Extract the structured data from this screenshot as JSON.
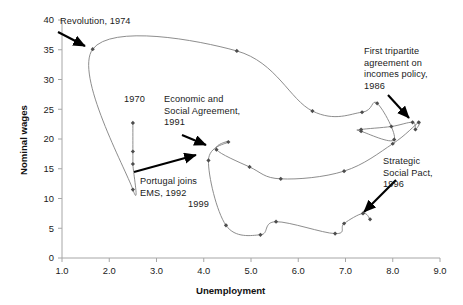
{
  "chart_data": {
    "type": "line",
    "title": "",
    "xlabel": "Unemployment",
    "ylabel": "Nominal wages",
    "xlim": [
      1.0,
      9.0
    ],
    "ylim": [
      0,
      40
    ],
    "xticks": [
      "1.0",
      "2.0",
      "3.0",
      "4.0",
      "5.0",
      "6.0",
      "7.0",
      "8.0",
      "9.0"
    ],
    "yticks": [
      "0",
      "5",
      "10",
      "15",
      "20",
      "25",
      "30",
      "35",
      "40"
    ],
    "grid": false,
    "legend": "none",
    "series": [
      {
        "name": "Unemployment vs nominal wages trajectory (1970-1999)",
        "points": [
          [
            2.5,
            22.7
          ],
          [
            2.5,
            17.9
          ],
          [
            2.5,
            15.8
          ],
          [
            2.5,
            11.5
          ],
          [
            1.65,
            35.1
          ],
          [
            4.7,
            34.8
          ],
          [
            6.3,
            24.7
          ],
          [
            7.35,
            24.5
          ],
          [
            7.67,
            26.0
          ],
          [
            8.03,
            19.9
          ],
          [
            7.33,
            21.3
          ],
          [
            7.33,
            21.6
          ],
          [
            7.97,
            22.1
          ],
          [
            8.42,
            22.8
          ],
          [
            8.48,
            21.6
          ],
          [
            8.55,
            22.8
          ],
          [
            8.0,
            19.2
          ],
          [
            6.97,
            14.6
          ],
          [
            5.63,
            13.3
          ],
          [
            4.97,
            15.3
          ],
          [
            4.27,
            18.2
          ],
          [
            4.52,
            19.5
          ],
          [
            4.1,
            16.4
          ],
          [
            4.47,
            5.5
          ],
          [
            5.2,
            3.9
          ],
          [
            5.53,
            6.1
          ],
          [
            6.78,
            4.1
          ],
          [
            6.97,
            5.8
          ],
          [
            7.37,
            7.5
          ],
          [
            7.52,
            6.5
          ]
        ]
      }
    ],
    "point_labels": [
      {
        "text": "1970",
        "x": 2.5,
        "y": 25.3
      },
      {
        "text": "1999",
        "x": 4.0,
        "y": 4.8
      }
    ],
    "annotations": [
      {
        "text": "Revolution, 1974",
        "lines": [
          "Revolution, 1974"
        ],
        "target_x": 1.65,
        "target_y": 35.1
      },
      {
        "text": "Economic and Social Agreement, 1991",
        "lines": [
          "Economic and",
          "Social Agreement,",
          "1991"
        ],
        "target_x": 4.27,
        "target_y": 18.2
      },
      {
        "text": "Portugal joins EMS, 1992",
        "lines": [
          "Portugal joins",
          "EMS, 1992"
        ],
        "target_x": 4.1,
        "target_y": 16.4
      },
      {
        "text": "First tripartite agreement on incomes policy, 1986",
        "lines": [
          "First tripartite",
          "agreement on",
          "incomes policy,",
          "1986"
        ],
        "target_x": 8.42,
        "target_y": 22.8
      },
      {
        "text": "Strategic Social Pact, 1996",
        "lines": [
          "Strategic",
          "Social Pact,",
          "1996"
        ],
        "target_x": 7.37,
        "target_y": 7.5
      }
    ],
    "style": {
      "line_color": "#808080",
      "marker_color": "#4d4d4d",
      "axis_color": "#a6a6a6",
      "text_color": "#1a1a1a",
      "arrow_color": "#000000",
      "background": "#ffffff"
    }
  },
  "axis": {
    "x_title": "Unemployment",
    "y_title": "Nominal wages",
    "x_tick_labels": [
      "1.0",
      "2.0",
      "3.0",
      "4.0",
      "5.0",
      "6.0",
      "7.0",
      "8.0",
      "9.0"
    ],
    "y_tick_labels": [
      "40",
      "35",
      "30",
      "25",
      "20",
      "15",
      "10",
      "5",
      "0"
    ]
  },
  "annotation_text": {
    "revolution": "Revolution, 1974",
    "year_1970": "1970",
    "year_1999": "1999",
    "economic_l1": "Economic and",
    "economic_l2": "Social Agreement,",
    "economic_l3": "1991",
    "ems_l1": "Portugal joins",
    "ems_l2": "EMS, 1992",
    "tripartite_l1": "First tripartite",
    "tripartite_l2": "agreement on",
    "tripartite_l3": "incomes policy,",
    "tripartite_l4": "1986",
    "pact_l1": "Strategic",
    "pact_l2": "Social Pact,",
    "pact_l3": "1996"
  }
}
